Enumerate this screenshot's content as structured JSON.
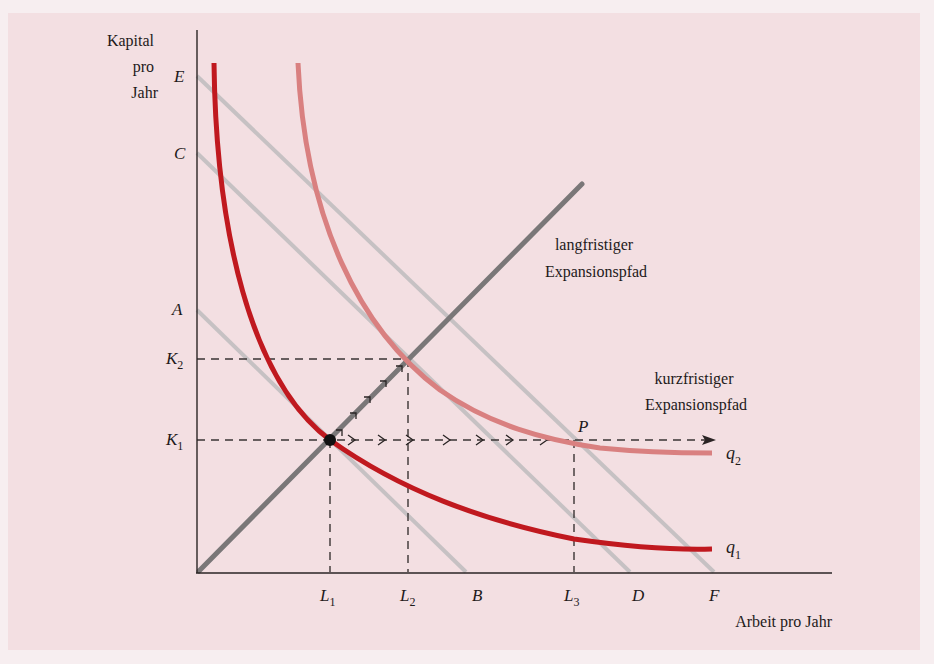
{
  "diagram": {
    "y_axis_label_lines": [
      "Kapital",
      "pro",
      "Jahr"
    ],
    "x_axis_label": "Arbeit pro Jahr",
    "y_ticks": {
      "E": "E",
      "C": "C",
      "A": "A",
      "K2": "K",
      "K2_sub": "2",
      "K1": "K",
      "K1_sub": "1"
    },
    "x_ticks": {
      "L1": "L",
      "L1_sub": "1",
      "L2": "L",
      "L2_sub": "2",
      "B": "B",
      "L3": "L",
      "L3_sub": "3",
      "D": "D",
      "F": "F"
    },
    "long_run_label_lines": [
      "langfristiger",
      "Expansionspfad"
    ],
    "short_run_label_lines": [
      "kurzfristiger",
      "Expansionspfad"
    ],
    "point_label": "P",
    "curve_labels": {
      "q2": "q",
      "q2_sub": "2",
      "q1": "q",
      "q1_sub": "1"
    },
    "colors": {
      "panel_bg": "#f3dfe2",
      "axis": "#2a2424",
      "isoquant_q1": "#c0191f",
      "isoquant_q2": "#d98080",
      "isocost": "#c4c0c2",
      "long_run_path": "#7a7778",
      "dashed": "#3a3434"
    }
  }
}
